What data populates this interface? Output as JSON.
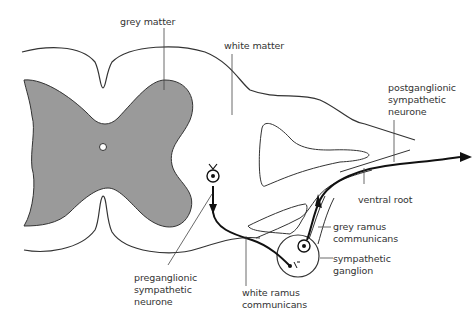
{
  "diagram": {
    "colors": {
      "grey_matter_fill": "#9a9a9a",
      "outline": "#333333",
      "pathway": "#111111",
      "label_text": "#333333"
    },
    "labels": {
      "grey_matter": "grey matter",
      "white_matter": "white matter",
      "postganglionic": "postganglionic\nsympathetic\nneurone",
      "ventral_root": "ventral root",
      "grey_ramus": "grey ramus\ncommunicans",
      "sympathetic_ganglion": "sympathetic\nganglion",
      "white_ramus": "white ramus\ncommunicans",
      "preganglionic": "preganglionic\nsympathetic\nneurone"
    },
    "icons": {
      "preganglionic_cell_body": "neuron-soma-icon",
      "postganglionic_cell_body": "neuron-soma-icon",
      "arrowhead": "arrow-icon"
    }
  }
}
